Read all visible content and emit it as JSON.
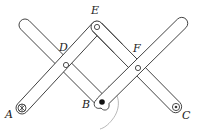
{
  "diagram": {
    "labels": {
      "A": "A",
      "B": "B",
      "C": "C",
      "D": "D",
      "E": "E",
      "F": "F"
    },
    "points": {
      "A": {
        "x": 22,
        "y": 108,
        "type": "fixed-pivot"
      },
      "B": {
        "x": 102,
        "y": 102,
        "type": "tracing-point"
      },
      "C": {
        "x": 176,
        "y": 107,
        "type": "pivot"
      },
      "D": {
        "x": 66,
        "y": 65,
        "type": "pivot"
      },
      "E": {
        "x": 97,
        "y": 27,
        "type": "pivot"
      },
      "F": {
        "x": 138,
        "y": 68,
        "type": "pivot"
      }
    },
    "colors": {
      "stroke": "#3a3a3a",
      "fill": "#ffffff",
      "label": "#222222",
      "trace": "#9a9a9a"
    }
  }
}
